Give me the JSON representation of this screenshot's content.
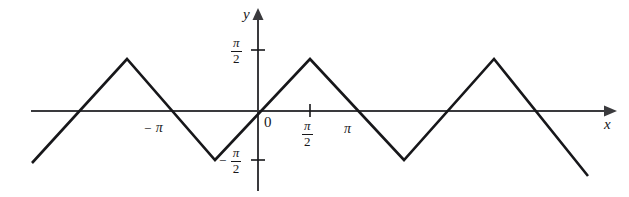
{
  "figure": {
    "title": "",
    "background_color": "#ffffff",
    "line_color": "#17171a",
    "axis_color": "#3a3a3d"
  },
  "axes": {
    "x_axis_name": "x",
    "y_axis_name": "y",
    "origin_label": "0"
  },
  "ticks": {
    "y_positive": {
      "numerator": "π",
      "denominator": "2",
      "sign": ""
    },
    "y_negative": {
      "numerator": "π",
      "denominator": "2",
      "sign": "−"
    },
    "x_half_pi": {
      "numerator": "π",
      "denominator": "2",
      "sign": ""
    },
    "x_pi": "π",
    "x_neg_pi_sign": "−",
    "x_neg_pi": "π"
  },
  "chart_data": {
    "type": "line",
    "title": "",
    "xlabel": "x",
    "ylabel": "y",
    "grid": false,
    "legend": null,
    "xlim": [
      -7.1,
      8.9
    ],
    "ylim": [
      -2.0,
      2.0
    ],
    "xtick_values": [
      -3.1416,
      0,
      1.5708,
      3.1416
    ],
    "xtick_labels": [
      "−π",
      "0",
      "π/2",
      "π"
    ],
    "ytick_values": [
      -1.5708,
      1.5708
    ],
    "ytick_labels": [
      "−π/2",
      "π/2"
    ],
    "x": [
      -7.08,
      -4.712,
      -1.571,
      1.571,
      4.712,
      7.854,
      8.87
    ],
    "y": [
      -1.178,
      1.5708,
      -1.5708,
      1.5708,
      -1.5708,
      1.5708,
      0.554
    ],
    "series": [
      {
        "name": "y = arcsin(sin x)",
        "x": [
          -7.08,
          -4.712,
          -1.571,
          1.571,
          4.712,
          7.854,
          8.87
        ],
        "y": [
          -1.178,
          1.5708,
          -1.5708,
          1.5708,
          -1.5708,
          1.5708,
          0.554
        ]
      }
    ],
    "pixel_geometry": {
      "y_axis_x": 258,
      "x_axis_y": 111,
      "peak_y": 59,
      "trough_y": 160,
      "vertices_px": [
        [
          32,
          163
        ],
        [
          127,
          59
        ],
        [
          215,
          160
        ],
        [
          310,
          59
        ],
        [
          404,
          160
        ],
        [
          494,
          59
        ],
        [
          588,
          176
        ]
      ]
    }
  }
}
